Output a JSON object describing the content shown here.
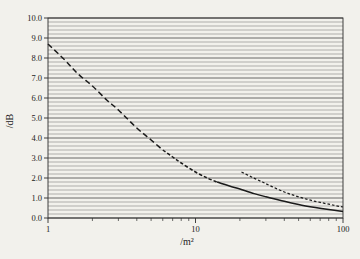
{
  "figure": {
    "background_color": "#f2f1ec"
  },
  "chart_data": {
    "type": "line",
    "title": "",
    "xlabel": "/m²",
    "ylabel": "/dB",
    "x_scale": "log",
    "xlim": [
      1,
      100
    ],
    "ylim": [
      0,
      10
    ],
    "y_major_step": 1.0,
    "y_minor_step": 0.2,
    "grid": "horizontal-only",
    "legend": "none",
    "x_tick_values": [
      1,
      10,
      100
    ],
    "x_tick_labels": [
      "1",
      "10",
      "100"
    ],
    "y_tick_values": [
      0,
      1,
      2,
      3,
      4,
      5,
      6,
      7,
      8,
      9,
      10
    ],
    "y_tick_labels": [
      "0.0",
      "1.0",
      "2.0",
      "3.0",
      "4.0",
      "5.0",
      "6.0",
      "7.0",
      "8.0",
      "9.0",
      "10.0"
    ],
    "colors": {
      "paper": "#f2f1ec",
      "grid_minor": "#686868",
      "grid_major": "#3c3c3c",
      "axis": "#2e2e2e",
      "curve": "#1b1b1b"
    },
    "series": [
      {
        "name": "main-attenuation-curve",
        "style": "dashed-merging-to-solid",
        "stroke_width": 1.5,
        "points": [
          [
            1,
            8.7
          ],
          [
            1.3,
            7.9
          ],
          [
            1.6,
            7.2
          ],
          [
            2,
            6.6
          ],
          [
            2.5,
            5.9
          ],
          [
            3,
            5.4
          ],
          [
            4,
            4.5
          ],
          [
            5,
            3.9
          ],
          [
            6,
            3.4
          ],
          [
            7,
            3.05
          ],
          [
            8,
            2.75
          ],
          [
            10,
            2.3
          ],
          [
            12,
            2.0
          ],
          [
            14,
            1.8
          ],
          [
            17,
            1.6
          ],
          [
            20,
            1.45
          ],
          [
            25,
            1.22
          ],
          [
            30,
            1.06
          ],
          [
            40,
            0.84
          ],
          [
            50,
            0.68
          ],
          [
            65,
            0.52
          ],
          [
            80,
            0.42
          ],
          [
            100,
            0.33
          ]
        ],
        "segments": [
          {
            "x_end": 6,
            "dash": "5.5 3.2"
          },
          {
            "x_end": 14,
            "dash": "3.4 2"
          },
          {
            "x_end": 100,
            "dash": ""
          }
        ]
      },
      {
        "name": "secondary-curve",
        "style": "dashed",
        "stroke_width": 1.25,
        "points": [
          [
            20.5,
            2.3
          ],
          [
            24,
            2.05
          ],
          [
            28,
            1.82
          ],
          [
            33,
            1.57
          ],
          [
            40,
            1.3
          ],
          [
            48,
            1.1
          ],
          [
            58,
            0.92
          ],
          [
            70,
            0.78
          ],
          [
            85,
            0.65
          ],
          [
            100,
            0.55
          ]
        ],
        "segments": [
          {
            "x_end": 100,
            "dash": "2.6 2"
          }
        ]
      }
    ]
  }
}
